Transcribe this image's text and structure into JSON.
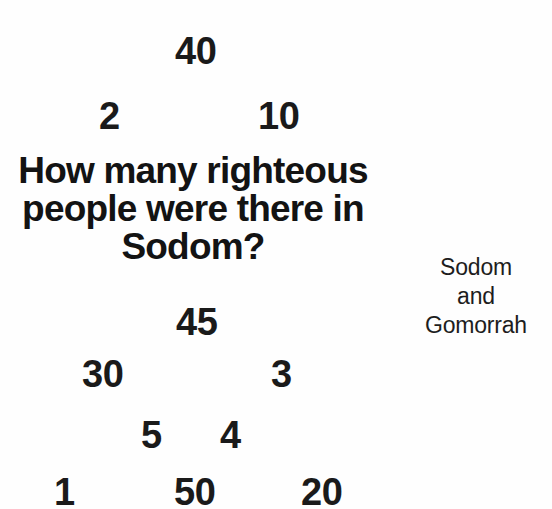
{
  "canvas": {
    "width": 552,
    "height": 509,
    "background_color": "#fefefe",
    "text_color": "#1a1a1a"
  },
  "question": {
    "full_text": "How many righteous people were there in Sodom?",
    "lines": [
      "How many righteous",
      "people were there in",
      "Sodom?"
    ]
  },
  "topic": {
    "full_text": "Sodom and Gomorrah",
    "lines": [
      "Sodom",
      "and",
      "Gomorrah"
    ]
  },
  "answer_options": [
    {
      "label": "40",
      "x": 175,
      "y": 32
    },
    {
      "label": "2",
      "x": 99,
      "y": 97
    },
    {
      "label": "10",
      "x": 258,
      "y": 97
    },
    {
      "label": "45",
      "x": 176,
      "y": 303
    },
    {
      "label": "30",
      "x": 82,
      "y": 355
    },
    {
      "label": "3",
      "x": 271,
      "y": 355
    },
    {
      "label": "5",
      "x": 141,
      "y": 416
    },
    {
      "label": "4",
      "x": 220,
      "y": 416
    },
    {
      "label": "1",
      "x": 54,
      "y": 473
    },
    {
      "label": "50",
      "x": 174,
      "y": 473
    },
    {
      "label": "20",
      "x": 301,
      "y": 473
    }
  ]
}
